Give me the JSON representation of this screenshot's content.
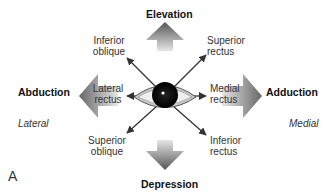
{
  "figure": {
    "panel_label": "A",
    "directions": {
      "top": "Elevation",
      "bottom": "Depression",
      "left": "Abduction",
      "right": "Adduction"
    },
    "sides": {
      "left": "Lateral",
      "right": "Medial"
    },
    "muscles": {
      "upper_left": {
        "line1": "Inferior",
        "line2": "oblique"
      },
      "upper_right": {
        "line1": "Superior",
        "line2": "rectus"
      },
      "left": {
        "line1": "Lateral",
        "line2": "rectus"
      },
      "right": {
        "line1": "Medial",
        "line2": "rectus"
      },
      "lower_left": {
        "line1": "Superior",
        "line2": "oblique"
      },
      "lower_right": {
        "line1": "Inferior",
        "line2": "rectus"
      }
    },
    "colors": {
      "arrow_dark": "#5a5a5a",
      "arrow_light": "#d8d8d8",
      "line": "#333333",
      "iris": "#111111"
    }
  }
}
